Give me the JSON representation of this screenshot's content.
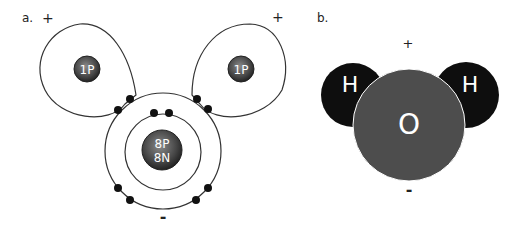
{
  "panel_a": {
    "label": "a.",
    "plus_left": "+",
    "plus_right": "+",
    "minus": "-",
    "hydrogen_left": "1P",
    "hydrogen_right": "1P",
    "oxygen_line1": "8P",
    "oxygen_line2": "8N"
  },
  "panel_b": {
    "label": "b.",
    "plus": "+",
    "minus": "-",
    "hydrogen_left": "H",
    "hydrogen_right": "H",
    "oxygen": "O"
  },
  "colors": {
    "nucleus": "#4a4a4a",
    "hydrogen_atom": "#0e0e0e",
    "oxygen_atom": "#4d4d4d",
    "electron": "#111111",
    "orbit": "#333333"
  }
}
